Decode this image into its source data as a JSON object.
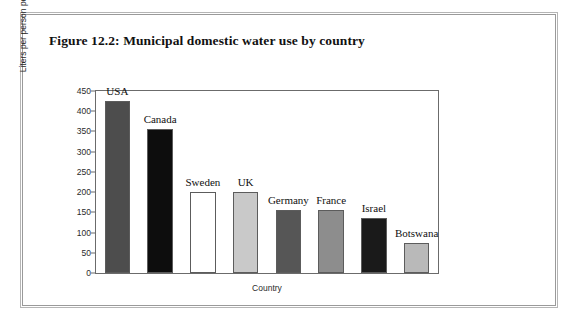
{
  "figure": {
    "title": "Figure 12.2: Municipal domestic water use by country"
  },
  "chart_data": {
    "type": "bar",
    "title": "Figure 12.2: Municipal domestic water use by country",
    "xlabel": "Country",
    "ylabel": "Liters per person per day",
    "categories": [
      "USA",
      "Canada",
      "Sweden",
      "UK",
      "Germany",
      "France",
      "Israel",
      "Botswana"
    ],
    "values": [
      425,
      355,
      200,
      200,
      155,
      155,
      135,
      75
    ],
    "ylim": [
      0,
      450
    ],
    "ytick_labels": [
      "0",
      "50",
      "100",
      "150",
      "200",
      "250",
      "300",
      "350",
      "400",
      "450"
    ],
    "ytick_values": [
      0,
      50,
      100,
      150,
      200,
      250,
      300,
      350,
      400,
      450
    ],
    "grid": false,
    "legend": "none",
    "bar_colors": [
      "#4d4d4d",
      "#0d0d0d",
      "#ffffff",
      "#c9c9c9",
      "#565656",
      "#8d8d8d",
      "#1a1a1a",
      "#b9b9b9"
    ],
    "bar_edge_color": "#5c5c5c",
    "axis_color": "#6b6b6b"
  }
}
